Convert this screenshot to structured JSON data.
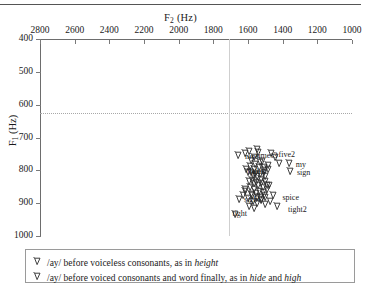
{
  "figure": {
    "top_rule": "",
    "x_axis": {
      "title": "F",
      "title_sub": "2",
      "title_unit": " (Hz)",
      "ticks": [
        2800,
        2600,
        2400,
        2200,
        2000,
        1800,
        1600,
        1400,
        1200,
        1000
      ],
      "min": 1000,
      "max": 2800,
      "reversed": true
    },
    "y_axis": {
      "title": "F",
      "title_sub": "1",
      "title_unit": " (Hz)",
      "ticks": [
        400,
        500,
        600,
        700,
        800,
        900,
        1000
      ],
      "min": 400,
      "max": 1000,
      "inverted": true
    },
    "reference_lines": {
      "horizontal_f1": 625,
      "vertical_f2": 1710
    }
  },
  "chart_data": {
    "type": "scatter",
    "title": "",
    "xlabel": "F2 (Hz)",
    "ylabel": "F1 (Hz)",
    "xlim": [
      2800,
      1000
    ],
    "ylim": [
      1000,
      400
    ],
    "grid": false,
    "legend_position": "below-plot",
    "annotations": [
      {
        "text": "nine",
        "x": 1640,
        "y": 758
      },
      {
        "text": "times3",
        "x": 1576,
        "y": 757
      },
      {
        "text": "five2",
        "x": 1447,
        "y": 752
      },
      {
        "text": "my",
        "x": 1347,
        "y": 783
      },
      {
        "text": "sign",
        "x": 1341,
        "y": 808
      },
      {
        "text": "fights",
        "x": 1628,
        "y": 805
      },
      {
        "text": "spice",
        "x": 1424,
        "y": 885
      },
      {
        "text": "sight",
        "x": 1646,
        "y": 890
      },
      {
        "text": "tight",
        "x": 1713,
        "y": 934
      },
      {
        "text": "tight2",
        "x": 1392,
        "y": 922
      }
    ],
    "series": [
      {
        "name": "/ay/ before voiceless consonants, as in height",
        "marker": "open-down-arrow",
        "points": [
          [
            1618,
            748
          ],
          [
            1597,
            742
          ],
          [
            1566,
            760
          ],
          [
            1546,
            745
          ],
          [
            1523,
            773
          ],
          [
            1589,
            788
          ],
          [
            1566,
            795
          ],
          [
            1540,
            790
          ],
          [
            1512,
            800
          ],
          [
            1487,
            783
          ],
          [
            1604,
            806
          ],
          [
            1575,
            815
          ],
          [
            1551,
            818
          ],
          [
            1528,
            826
          ],
          [
            1503,
            818
          ],
          [
            1598,
            832
          ],
          [
            1571,
            840
          ],
          [
            1546,
            845
          ],
          [
            1519,
            852
          ],
          [
            1494,
            846
          ],
          [
            1618,
            862
          ],
          [
            1583,
            872
          ],
          [
            1556,
            868
          ],
          [
            1533,
            880
          ],
          [
            1509,
            874
          ],
          [
            1602,
            884
          ],
          [
            1575,
            892
          ],
          [
            1549,
            898
          ],
          [
            1527,
            890
          ],
          [
            1502,
            902
          ],
          [
            1630,
            876
          ],
          [
            1656,
            886
          ],
          [
            1679,
            934
          ],
          [
            1448,
            758
          ],
          [
            1423,
            778
          ]
        ]
      },
      {
        "name": "/ay/ before voiced consonants and word finally, as in hide and high",
        "marker": "open-down-arrow",
        "points": [
          [
            1660,
            752
          ],
          [
            1549,
            735
          ],
          [
            1472,
            748
          ],
          [
            1368,
            778
          ],
          [
            1360,
            802
          ],
          [
            1588,
            770
          ],
          [
            1560,
            782
          ],
          [
            1536,
            775
          ],
          [
            1512,
            790
          ],
          [
            1489,
            795
          ],
          [
            1612,
            796
          ],
          [
            1585,
            805
          ],
          [
            1560,
            810
          ],
          [
            1534,
            812
          ],
          [
            1509,
            806
          ],
          [
            1578,
            828
          ],
          [
            1556,
            836
          ],
          [
            1530,
            838
          ],
          [
            1505,
            832
          ],
          [
            1480,
            844
          ],
          [
            1593,
            852
          ],
          [
            1566,
            858
          ],
          [
            1541,
            862
          ],
          [
            1516,
            866
          ],
          [
            1492,
            858
          ],
          [
            1579,
            876
          ],
          [
            1552,
            882
          ],
          [
            1528,
            888
          ],
          [
            1503,
            882
          ],
          [
            1478,
            892
          ],
          [
            1460,
            876
          ],
          [
            1437,
            910
          ],
          [
            1598,
            908
          ],
          [
            1569,
            916
          ],
          [
            1622,
            856
          ]
        ]
      }
    ]
  },
  "legend": {
    "items": [
      {
        "marker": "open-down-arrow",
        "prefix": "/ay/ before voiceless consonants, as in ",
        "italic1": "height",
        "middle": "",
        "italic2": "",
        "suffix": ""
      },
      {
        "marker": "open-down-arrow",
        "prefix": "/ay/ before voiced consonants and word finally, as in ",
        "italic1": "hide",
        "middle": " and ",
        "italic2": "high",
        "suffix": ""
      }
    ]
  }
}
